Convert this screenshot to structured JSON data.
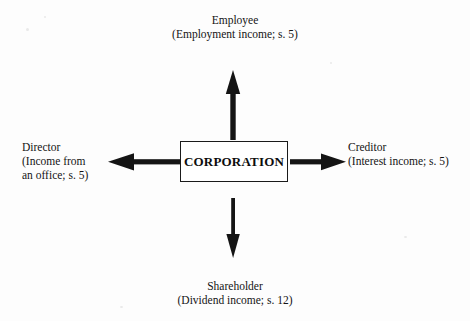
{
  "diagram": {
    "center": {
      "label": "CORPORATION"
    },
    "nodes": [
      {
        "id": "employee",
        "position": "top",
        "name": "Employee",
        "detail": "(Employment income; s. 5)",
        "text": "Employee\n(Employment income; s. 5)"
      },
      {
        "id": "creditor",
        "position": "right",
        "name": "Creditor",
        "detail": "(Interest income; s. 5)",
        "text": "Creditor\n(Interest income; s. 5)"
      },
      {
        "id": "shareholder",
        "position": "bottom",
        "name": "Shareholder",
        "detail": "(Dividend income; s. 12)",
        "text": "Shareholder\n(Dividend income; s. 12)"
      },
      {
        "id": "director",
        "position": "left",
        "name": "Director",
        "detail": "(Income from an office; s. 5)",
        "text": "Director\n(Income from\nan office; s. 5)"
      }
    ],
    "arrows": [
      {
        "id": "arrow-up",
        "from": "CORPORATION",
        "to": "Employee",
        "direction": "up"
      },
      {
        "id": "arrow-right",
        "from": "CORPORATION",
        "to": "Creditor",
        "direction": "right"
      },
      {
        "id": "arrow-down",
        "from": "CORPORATION",
        "to": "Shareholder",
        "direction": "down"
      },
      {
        "id": "arrow-left",
        "from": "CORPORATION",
        "to": "Director",
        "direction": "left"
      }
    ],
    "colors": {
      "ink": "#141414",
      "background": "#fdfdfd",
      "box_border": "#1a1a1a"
    }
  }
}
